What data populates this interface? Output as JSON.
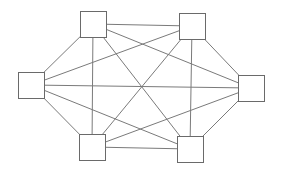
{
  "diagram": {
    "type": "full-mesh-network",
    "colors": {
      "background": "#ffffff",
      "edge": "#7a7a7a",
      "node_stroke": "#6a6a6a",
      "node_fill": "#ffffff"
    },
    "node_size": 26,
    "nodes": [
      {
        "id": "top-left",
        "x": 80,
        "y": 11
      },
      {
        "id": "top-right",
        "x": 179,
        "y": 13
      },
      {
        "id": "left",
        "x": 18,
        "y": 72
      },
      {
        "id": "right",
        "x": 238,
        "y": 75
      },
      {
        "id": "bottom-left",
        "x": 79,
        "y": 134
      },
      {
        "id": "bottom-right",
        "x": 177,
        "y": 136
      }
    ],
    "edges": [
      [
        "top-left",
        "top-right"
      ],
      [
        "top-left",
        "left"
      ],
      [
        "top-left",
        "right"
      ],
      [
        "top-left",
        "bottom-left"
      ],
      [
        "top-left",
        "bottom-right"
      ],
      [
        "top-right",
        "left"
      ],
      [
        "top-right",
        "right"
      ],
      [
        "top-right",
        "bottom-left"
      ],
      [
        "top-right",
        "bottom-right"
      ],
      [
        "left",
        "right"
      ],
      [
        "left",
        "bottom-left"
      ],
      [
        "left",
        "bottom-right"
      ],
      [
        "right",
        "bottom-left"
      ],
      [
        "right",
        "bottom-right"
      ],
      [
        "bottom-left",
        "bottom-right"
      ]
    ]
  }
}
